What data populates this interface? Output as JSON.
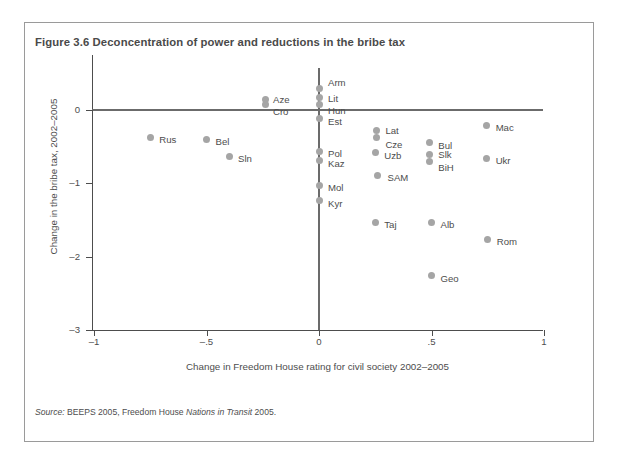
{
  "figure": {
    "title": "Figure 3.6  Deconcentration of power and reductions in the bribe tax",
    "source_prefix": "Source:",
    "source_text_1": " BEEPS 2005, Freedom House ",
    "source_italic": "Nations in Transit",
    "source_text_2": " 2005.",
    "frame_border_color": "#9a9a9a",
    "marker_color": "#a5a5a5",
    "axis_color": "#4d4d4d",
    "reference_line_color": "#6b6b6b"
  },
  "chart_data": {
    "type": "scatter",
    "title": "Figure 3.6  Deconcentration of power and reductions in the bribe tax",
    "xlabel": "Change in Freedom House rating for civil society 2002–2005",
    "ylabel": "Change in the bribe tax, 2002–2005",
    "xlim": [
      -1,
      1
    ],
    "ylim": [
      -3,
      0.35
    ],
    "xticks": [
      -1,
      -0.5,
      0,
      0.5,
      1
    ],
    "xticklabels": [
      "–1",
      "–.5",
      "0",
      ".5",
      "1"
    ],
    "yticks": [
      0,
      -1,
      -2,
      -3
    ],
    "yticklabels": [
      "0",
      "–1",
      "–2",
      "–3"
    ],
    "grid": false,
    "legend": false,
    "reference_lines": {
      "horizontal": 0,
      "vertical": 0
    },
    "points": [
      {
        "label": "Arm",
        "x": 0.0,
        "y": 0.3,
        "lx": 9,
        "ly": -10
      },
      {
        "label": "Lit",
        "x": 0.0,
        "y": 0.17,
        "lx": 9,
        "ly": -4
      },
      {
        "label": "Hun",
        "x": 0.0,
        "y": 0.07,
        "lx": 9,
        "ly": 1
      },
      {
        "label": "Aze",
        "x": -0.24,
        "y": 0.14,
        "lx": 8,
        "ly": -5
      },
      {
        "label": "Cro",
        "x": -0.24,
        "y": 0.07,
        "lx": 8,
        "ly": 2
      },
      {
        "label": "Est",
        "x": 0.0,
        "y": -0.12,
        "lx": 9,
        "ly": -2
      },
      {
        "label": "Rus",
        "x": -0.75,
        "y": -0.37,
        "lx": 9,
        "ly": -2
      },
      {
        "label": "Bel",
        "x": -0.5,
        "y": -0.4,
        "lx": 9,
        "ly": -2
      },
      {
        "label": "Lat",
        "x": 0.255,
        "y": -0.28,
        "lx": 9,
        "ly": -5
      },
      {
        "label": "Cze",
        "x": 0.255,
        "y": -0.38,
        "lx": 9,
        "ly": 2
      },
      {
        "label": "Mac",
        "x": 0.745,
        "y": -0.21,
        "lx": 9,
        "ly": -2
      },
      {
        "label": "Bul",
        "x": 0.49,
        "y": -0.45,
        "lx": 9,
        "ly": -2
      },
      {
        "label": "Sln",
        "x": -0.4,
        "y": -0.63,
        "lx": 9,
        "ly": -2
      },
      {
        "label": "Uzb",
        "x": 0.25,
        "y": -0.58,
        "lx": 9,
        "ly": -2
      },
      {
        "label": "Slk",
        "x": 0.49,
        "y": -0.61,
        "lx": 9,
        "ly": -5
      },
      {
        "label": "BiH",
        "x": 0.49,
        "y": -0.7,
        "lx": 9,
        "ly": 2
      },
      {
        "label": "Ukr",
        "x": 0.745,
        "y": -0.66,
        "lx": 9,
        "ly": -2
      },
      {
        "label": "Pol",
        "x": 0.0,
        "y": -0.56,
        "lx": 9,
        "ly": -2
      },
      {
        "label": "Kaz",
        "x": 0.0,
        "y": -0.69,
        "lx": 9,
        "ly": -2
      },
      {
        "label": "SAM",
        "x": 0.26,
        "y": -0.89,
        "lx": 10,
        "ly": -2
      },
      {
        "label": "Mol",
        "x": 0.0,
        "y": -1.03,
        "lx": 9,
        "ly": -2
      },
      {
        "label": "Kyr",
        "x": 0.0,
        "y": -1.24,
        "lx": 9,
        "ly": -2
      },
      {
        "label": "Taj",
        "x": 0.25,
        "y": -1.53,
        "lx": 9,
        "ly": -2
      },
      {
        "label": "Alb",
        "x": 0.5,
        "y": -1.53,
        "lx": 9,
        "ly": -2
      },
      {
        "label": "Rom",
        "x": 0.75,
        "y": -1.76,
        "lx": 9,
        "ly": -2
      },
      {
        "label": "Geo",
        "x": 0.5,
        "y": -2.26,
        "lx": 9,
        "ly": -2
      }
    ]
  }
}
